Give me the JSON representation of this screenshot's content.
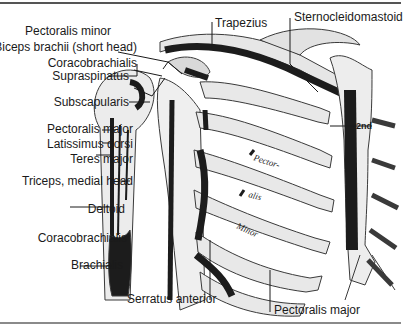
{
  "figure": {
    "type": "anatomical-diagram",
    "labels_left": [
      {
        "id": "pectoralis-minor-top",
        "text": "Pectoralis minor"
      },
      {
        "id": "biceps-short-head",
        "text": "Biceps brachii (short head)"
      },
      {
        "id": "coracobrachialis-top",
        "text": "Coracobrachialis"
      },
      {
        "id": "supraspinatus",
        "text": "Supraspinatus"
      },
      {
        "id": "subscapularis",
        "text": "Subscapularis"
      },
      {
        "id": "pectoralis-major-arm",
        "text": "Pectoralis major"
      },
      {
        "id": "latissimus-dorsi",
        "text": "Latissimus dorsi"
      },
      {
        "id": "teres-major",
        "text": "Teres major"
      },
      {
        "id": "triceps-medial",
        "text": "Triceps, medial head"
      },
      {
        "id": "deltoid",
        "text": "Deltoid"
      },
      {
        "id": "coracobrachialis-arm",
        "text": "Coracobrachialis"
      },
      {
        "id": "brachialis",
        "text": "Brachialis"
      }
    ],
    "labels_top": [
      {
        "id": "trapezius",
        "text": "Trapezius"
      },
      {
        "id": "sternocleidomastoid",
        "text": "Sternocleidomastoid"
      }
    ],
    "labels_bottom": [
      {
        "id": "serratus-anterior",
        "text": "Serratus anterior"
      },
      {
        "id": "pectoralis-major-chest",
        "text": "Pectoralis major"
      }
    ],
    "inline_labels": {
      "rib_text_1": "Pector-",
      "rib_text_2": "alis",
      "rib_text_3": "Minor",
      "rib_number": "2nd"
    }
  },
  "colors": {
    "muscle_attachment": "#1c1c1c",
    "bone": "#ececec",
    "bone_outline": "#3a3a3a",
    "label_text": "#1a1a1a",
    "frame": "#555555"
  }
}
